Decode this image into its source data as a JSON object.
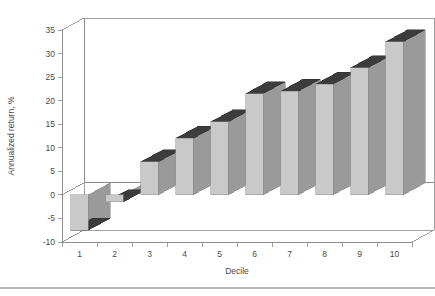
{
  "chart_data": {
    "type": "bar",
    "title": "",
    "subtitle": "",
    "xlabel": "Decile",
    "ylabel": "Annualized return, %",
    "categories": [
      "1",
      "2",
      "3",
      "4",
      "5",
      "6",
      "7",
      "8",
      "9",
      "10"
    ],
    "values": [
      -7.5,
      -1.5,
      7.0,
      12.0,
      15.5,
      21.5,
      22.0,
      23.5,
      27.0,
      32.5
    ],
    "ylim": [
      -10,
      35
    ],
    "yticks": [
      -10,
      -5,
      0,
      5,
      10,
      15,
      20,
      25,
      30,
      35
    ],
    "ytick_labels": [
      "-10",
      "-5",
      "0",
      "5",
      "10",
      "15",
      "20",
      "25",
      "30",
      "35"
    ],
    "xtick_labels": [
      "1",
      "2",
      "3",
      "4",
      "5",
      "6",
      "7",
      "8",
      "9",
      "10"
    ],
    "grid": true,
    "grid_style": "dotted-horizontal",
    "legend": null,
    "style": "3d-column",
    "colors": {
      "bar_front": "#c9c9c9",
      "bar_side": "#9a9a9a",
      "bar_top": "#3c3c3c",
      "wall": "#ffffff",
      "floor": "#ffffff",
      "axis_line": "#8a8a8a",
      "grid_line": "#b6b6b6",
      "text": "#4a4a4a",
      "footer_rule": "#b9b9b9",
      "background": "#ffffff"
    }
  },
  "figure": {
    "footer_rule_visible": true
  }
}
